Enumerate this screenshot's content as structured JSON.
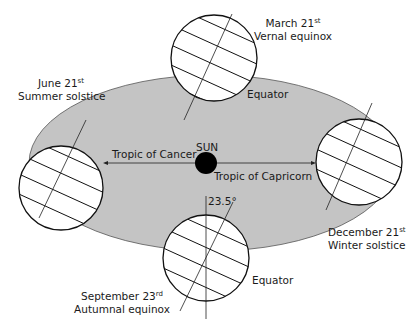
{
  "colors": {
    "orbit_fill": "#c4c4c4",
    "orbit_stroke": "#555555",
    "earth_fill": "#ffffff",
    "line": "#1a1a1a",
    "sun": "#000000"
  },
  "sun": {
    "label": "SUN"
  },
  "positions": [
    {
      "id": "march",
      "date": "March 21",
      "suffix": "st",
      "event": "Vernal equinox"
    },
    {
      "id": "june",
      "date": "June 21",
      "suffix": "st",
      "event": "Summer solstice"
    },
    {
      "id": "september",
      "date": "September 23",
      "suffix": "rd",
      "event": "Autumnal equinox"
    },
    {
      "id": "december",
      "date": "December 21",
      "suffix": "st",
      "event": "Winter solstice"
    }
  ],
  "annotations": {
    "tropic_cancer": "Tropic of Cancer",
    "tropic_capricorn": "Tropic of Capricorn",
    "equator_top": "Equator",
    "equator_bottom": "Equator",
    "tilt": "23.5°"
  }
}
